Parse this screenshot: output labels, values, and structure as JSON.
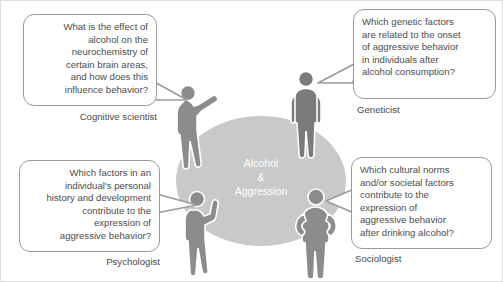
{
  "figure": {
    "center": {
      "line1": "Alcohol",
      "line2": "&",
      "line3": "Aggression",
      "ellipse_color": "#c9c9c9",
      "text_color": "#ffffff"
    },
    "bubble_border_color": "#9a9a9a",
    "bubble_text_color": "#4d4d4d",
    "perspectives": [
      {
        "id": "cognitive-scientist",
        "role": "Cognitive scientist",
        "question": "What is the effect of alcohol on the neurochemistry of certain brain areas, and how does this influence behavior?",
        "lines": [
          "What is the effect of",
          "alcohol on the",
          "neurochemistry of",
          "certain brain areas,",
          "and how does this",
          "influence behavior?"
        ],
        "align": "right",
        "person_color": "#8c8c8c"
      },
      {
        "id": "geneticist",
        "role": "Geneticist",
        "question": "Which genetic factors are related to the onset of aggressive behavior in individuals after alcohol consumption?",
        "lines": [
          "Which genetic factors",
          "are related to the onset",
          "of aggressive behavior",
          "in individuals after",
          "alcohol consumption?"
        ],
        "align": "left",
        "person_color": "#7b7b7b"
      },
      {
        "id": "psychologist",
        "role": "Psychologist",
        "question": "Which factors in an individual's personal history and development contribute to the expression of aggressive behavior?",
        "lines": [
          "Which factors in an",
          "individual's personal",
          "history and development",
          "contribute to the",
          "expression of",
          "aggressive behavior?"
        ],
        "align": "right",
        "person_color": "#8c8c8c"
      },
      {
        "id": "sociologist",
        "role": "Sociologist",
        "question": "Which cultural norms and/or societal factors contribute to the expression of aggressive behavior after drinking alcohol?",
        "lines": [
          "Which cultural norms",
          "and/or societal factors",
          "contribute to the",
          "expression of",
          "aggressive behavior",
          "after drinking alcohol?"
        ],
        "align": "left",
        "person_color": "#8c8c8c"
      }
    ]
  }
}
